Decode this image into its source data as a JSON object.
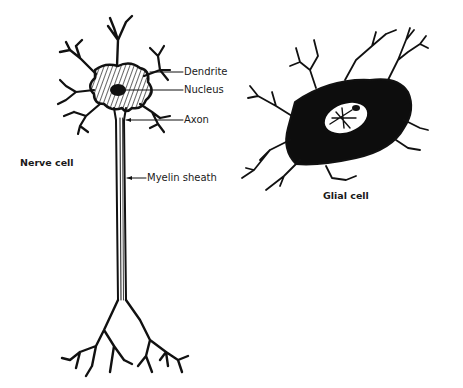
{
  "diagram": {
    "nerve_cell": {
      "title": "Nerve cell",
      "labels": {
        "dendrite": "Dendrite",
        "nucleus": "Nucleus",
        "axon": "Axon",
        "myelin": "Myelin sheath"
      }
    },
    "glial_cell": {
      "title": "Glial cell"
    },
    "colors": {
      "ink": "#111111",
      "background": "#ffffff"
    }
  }
}
